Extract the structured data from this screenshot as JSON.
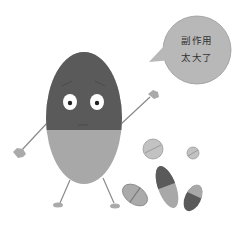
{
  "illustration": {
    "subject": "cartoon pill character with speech bubble",
    "speech_bubble": {
      "lines": [
        "副作用",
        "太大了"
      ]
    },
    "colors": {
      "pill_top": "#5a5a5a",
      "pill_bottom": "#a8a8a8",
      "bubble": "#b8b8b8",
      "small_pill_light": "#bdbdbd",
      "small_pill_dark": "#595959"
    }
  }
}
